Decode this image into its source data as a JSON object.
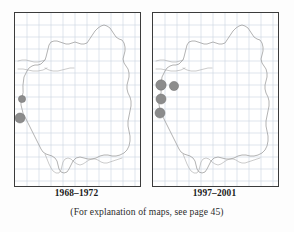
{
  "figure": {
    "type": "distribution-map-pair",
    "caption": "(For explanation of maps, see page 45)",
    "colors": {
      "dot_fill": "#8c8c8c",
      "dot_stroke": "#6e6e6e",
      "grid_line": "#c9d4e0",
      "coastline": "#9a9a9a",
      "panel_border": "#3b3b3b",
      "background": "#ffffff"
    },
    "panels": [
      {
        "id": "left",
        "label": "1968–1972",
        "grid": {
          "columns": 10,
          "rows": 14,
          "spacing_px": 12,
          "visible": true
        },
        "records": [
          {
            "cx": 7,
            "cy": 86,
            "r": 3.6
          },
          {
            "cx": 5,
            "cy": 105,
            "r": 5.0
          }
        ]
      },
      {
        "id": "right",
        "label": "1997–2001",
        "grid": {
          "columns": 10,
          "rows": 14,
          "spacing_px": 12,
          "visible": true
        },
        "records": [
          {
            "cx": 8,
            "cy": 72,
            "r": 5.2
          },
          {
            "cx": 21,
            "cy": 73,
            "r": 4.6
          },
          {
            "cx": 8,
            "cy": 86,
            "r": 5.0
          },
          {
            "cx": 7,
            "cy": 100,
            "r": 5.0
          }
        ]
      }
    ],
    "coastline_path": "M 8 72 L 9 64 L 12 58 L 14 55 L 17 53 L 20 52 L 23 52 L 26 51 L 28 49 L 30 47 L 31 44 L 32 40 L 33 36 L 34 32 L 36 29 L 39 28 L 42 28 L 45 29 L 48 30 L 51 31 L 54 31 L 57 30 L 60 29 L 63 30 L 66 31 L 69 31 L 72 30 L 74 27 L 76 24 L 78 21 L 80 18 L 83 15 L 86 13 L 89 12 L 92 13 L 95 15 L 97 18 L 99 21 L 101 24 L 104 26 L 107 27 L 109 30 L 110 34 L 110 38 L 109 42 L 108 46 L 109 50 L 111 53 L 113 56 L 114 60 L 114 64 L 113 68 L 112 72 L 112 76 L 113 80 L 115 84 L 116 88 L 116 93 L 115 98 L 114 103 L 113 108 L 113 113 L 114 118 L 115 123 L 115 128 L 114 133 L 112 137 L 109 140 L 105 142 L 101 143 L 97 143 L 93 142 L 89 142 L 85 143 L 81 145 L 77 146 L 73 146 L 69 145 L 65 144 L 61 145 L 58 148 L 56 152 L 54 156 L 52 159 L 49 160 L 46 159 L 44 156 L 43 152 L 42 148 L 40 145 L 37 143 L 34 142 L 31 141 L 28 139 L 26 136 L 24 132 L 22 128 L 20 124 L 18 120 L 16 116 L 14 112 L 12 108 L 10 104 L 8 100 L 7 96 L 6 92 L 6 88 L 7 84 L 8 80 Z",
    "coastline_inner_path": "M 3 48 L 7 47 L 11 47 L 15 48 L 19 49 L 23 49 L 27 48 L 30 47 M 3 56 L 8 56 L 13 57 L 18 58 L 23 58 L 28 57 L 32 55 M 30 55 L 34 57 L 38 58 L 43 58 L 47 57 L 51 56 L 55 55 L 59 55",
    "coastline_south_path": "M 30 141 L 32 146 L 34 151 L 36 155 L 38 158 L 41 160 L 44 160 L 46 157 L 47 153 L 48 149 L 50 146 L 53 145 L 56 146 L 59 149 L 62 151 L 65 152 L 68 151 L 71 149 L 74 147 L 77 146 L 80 146 L 83 147 L 86 149 L 89 150 L 92 150 L 95 149 L 98 148 L 101 147 L 104 146 L 107 145"
  }
}
